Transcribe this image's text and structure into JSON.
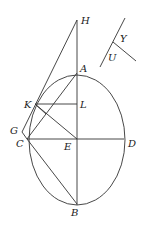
{
  "diagram": {
    "labels": {
      "H": "H",
      "A": "A",
      "K": "K",
      "L": "L",
      "G": "G",
      "C": "C",
      "E": "E",
      "D": "D",
      "B": "B",
      "Y": "Y",
      "U": "U"
    },
    "points": {
      "H": [
        77,
        20
      ],
      "A": [
        77,
        73
      ],
      "L": [
        77,
        104
      ],
      "E": [
        77,
        139
      ],
      "B": [
        77,
        204
      ],
      "D": [
        124,
        139
      ],
      "C": [
        27,
        139
      ],
      "K": [
        35,
        104
      ],
      "G": [
        22,
        132
      ]
    },
    "ellipse": {
      "cx": 77,
      "cy": 139,
      "rx": 48,
      "ry": 66
    },
    "stroke_color": "#333333"
  }
}
